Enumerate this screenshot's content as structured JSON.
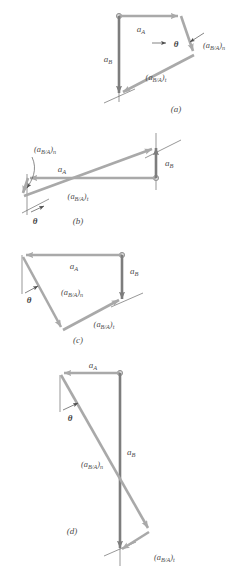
{
  "figure": {
    "colors": {
      "vector_light": "#a9a9a9",
      "vector_dark": "#7d7d7d",
      "reference_line": "#5a5a5a",
      "leader_line": "#595959",
      "text": "#4d4d4d",
      "background": "#ffffff"
    },
    "labels": {
      "a_A": "a",
      "a_A_sub": "A",
      "a_B": "a",
      "a_B_sub": "B",
      "a_BA_n_open": "(a",
      "a_BA_n_sub": "B/A",
      "a_BA_n_close": ")",
      "a_BA_n_suffix": "n",
      "a_BA_t_open": "(a",
      "a_BA_t_sub": "B/A",
      "a_BA_t_close": ")",
      "a_BA_t_suffix": "t",
      "theta": "θ"
    },
    "panels": [
      {
        "id": "a",
        "caption": "(a)",
        "description": "a_A points right from pivot, a_B points down, (a_B/A)_n short down-right, (a_B/A)_t long down-left closing the polygon",
        "vectors": [
          "a_A",
          "a_B",
          "(a_B/A)_n",
          "(a_B/A)_t"
        ],
        "angle": "θ"
      },
      {
        "id": "b",
        "caption": "(b)",
        "description": "a_A points left from pivot, a_B points up, (a_B/A)_n short down-left, (a_B/A)_t long up-right closing the polygon",
        "vectors": [
          "a_A",
          "a_B",
          "(a_B/A)_n",
          "(a_B/A)_t"
        ],
        "angle": "θ"
      },
      {
        "id": "c",
        "caption": "(c)",
        "description": "a_A points left from pivot, a_B points down, (a_B/A)_n long down-right-to-left, (a_B/A)_t up-right closing the polygon",
        "vectors": [
          "a_A",
          "a_B",
          "(a_B/A)_n",
          "(a_B/A)_t"
        ],
        "angle": "θ"
      },
      {
        "id": "d",
        "caption": "(d)",
        "description": "a_A points left from pivot, a_B long down, (a_B/A)_n long diagonal down-right, (a_B/A)_t up-left closing the polygon",
        "vectors": [
          "a_A",
          "a_B",
          "(a_B/A)_n",
          "(a_B/A)_t"
        ],
        "angle": "θ"
      }
    ]
  }
}
